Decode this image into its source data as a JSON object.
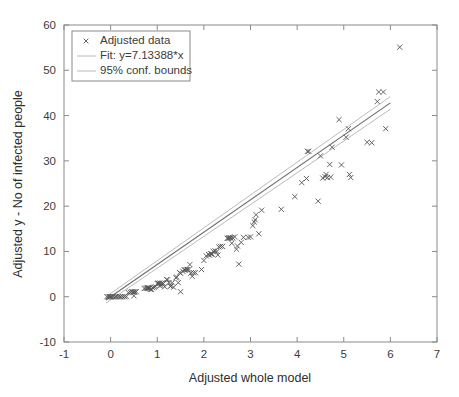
{
  "chart_data": {
    "type": "scatter",
    "title": "",
    "xlabel": "Adjusted whole model",
    "ylabel": "Adjusted y - No of infected people",
    "xlim": [
      -1,
      7
    ],
    "ylim": [
      -10,
      60
    ],
    "xticks": [
      -1,
      0,
      1,
      2,
      3,
      4,
      5,
      6,
      7
    ],
    "xticklabels": [
      "-1",
      "0",
      "1",
      "2",
      "3",
      "4",
      "5",
      "6",
      "7"
    ],
    "yticks": [
      -10,
      0,
      10,
      20,
      30,
      40,
      50,
      60
    ],
    "yticklabels": [
      "-10",
      "0",
      "10",
      "20",
      "30",
      "40",
      "50",
      "60"
    ],
    "grid": false,
    "legend_position": "upper-left",
    "legend": [
      {
        "label": "Adjusted data",
        "marker": "x",
        "type": "marker"
      },
      {
        "label": "Fit: y=7.13388*x",
        "marker": "line",
        "type": "line"
      },
      {
        "label": "95% conf. bounds",
        "marker": "line",
        "type": "line"
      }
    ],
    "fit": {
      "equation": "y=7.13388*x",
      "slope": 7.13388,
      "intercept": 0,
      "x_start": -0.1,
      "x_end": 6.0
    },
    "confidence": {
      "level": "95%",
      "half_width_at_x_start": 0.7,
      "half_width_at_x_end": 1.4
    },
    "series": [
      {
        "name": "Adjusted data",
        "marker": "x",
        "points": [
          [
            -0.08,
            0.0
          ],
          [
            -0.05,
            0.0
          ],
          [
            -0.02,
            0.0
          ],
          [
            0.0,
            0.0
          ],
          [
            0.03,
            0.0
          ],
          [
            0.06,
            0.0
          ],
          [
            0.1,
            0.0
          ],
          [
            0.16,
            0.0
          ],
          [
            0.22,
            0.0
          ],
          [
            0.3,
            0.0
          ],
          [
            0.38,
            0.9
          ],
          [
            0.42,
            1.0
          ],
          [
            0.45,
            1.1
          ],
          [
            0.48,
            1.1
          ],
          [
            0.5,
            1.0
          ],
          [
            0.52,
            1.1
          ],
          [
            0.55,
            1.1
          ],
          [
            0.5,
            0.2
          ],
          [
            0.72,
            1.8
          ],
          [
            0.75,
            1.9
          ],
          [
            0.78,
            1.9
          ],
          [
            0.8,
            1.9
          ],
          [
            0.82,
            1.9
          ],
          [
            0.85,
            1.6
          ],
          [
            0.88,
            1.6
          ],
          [
            0.9,
            2.0
          ],
          [
            0.93,
            2.1
          ],
          [
            0.96,
            2.2
          ],
          [
            1.0,
            2.9
          ],
          [
            1.02,
            3.0
          ],
          [
            1.05,
            2.4
          ],
          [
            1.08,
            2.5
          ],
          [
            1.1,
            3.0
          ],
          [
            1.13,
            2.9
          ],
          [
            1.16,
            2.2
          ],
          [
            1.2,
            3.8
          ],
          [
            1.22,
            3.7
          ],
          [
            1.25,
            3.1
          ],
          [
            1.28,
            2.3
          ],
          [
            1.3,
            2.4
          ],
          [
            1.32,
            3.1
          ],
          [
            1.35,
            2.1
          ],
          [
            1.4,
            4.2
          ],
          [
            1.42,
            4.3
          ],
          [
            1.45,
            3.1
          ],
          [
            1.48,
            5.3
          ],
          [
            1.5,
            5.2
          ],
          [
            1.5,
            1.1
          ],
          [
            1.55,
            5.6
          ],
          [
            1.58,
            5.9
          ],
          [
            1.6,
            5.9
          ],
          [
            1.62,
            6.0
          ],
          [
            1.65,
            6.0
          ],
          [
            1.68,
            6.0
          ],
          [
            1.7,
            7.1
          ],
          [
            1.72,
            5.2
          ],
          [
            1.75,
            4.5
          ],
          [
            1.78,
            5.3
          ],
          [
            1.82,
            5.3
          ],
          [
            1.95,
            6.0
          ],
          [
            2.0,
            8.0
          ],
          [
            2.05,
            9.0
          ],
          [
            2.1,
            9.3
          ],
          [
            2.15,
            9.5
          ],
          [
            2.18,
            9.4
          ],
          [
            2.2,
            10.0
          ],
          [
            2.24,
            10.1
          ],
          [
            2.28,
            10.0
          ],
          [
            2.3,
            9.2
          ],
          [
            2.32,
            11.0
          ],
          [
            2.36,
            11.1
          ],
          [
            2.4,
            11.1
          ],
          [
            2.5,
            12.9
          ],
          [
            2.54,
            13.0
          ],
          [
            2.58,
            13.0
          ],
          [
            2.62,
            13.0
          ],
          [
            2.6,
            11.8
          ],
          [
            2.66,
            13.2
          ],
          [
            2.7,
            10.5
          ],
          [
            2.72,
            11.2
          ],
          [
            2.75,
            7.2
          ],
          [
            2.8,
            12.0
          ],
          [
            2.85,
            13.1
          ],
          [
            2.95,
            13.1
          ],
          [
            3.0,
            13.2
          ],
          [
            3.05,
            15.7
          ],
          [
            3.08,
            16.5
          ],
          [
            3.1,
            17.0
          ],
          [
            3.12,
            18.1
          ],
          [
            3.18,
            13.9
          ],
          [
            3.24,
            19.1
          ],
          [
            3.66,
            19.3
          ],
          [
            3.95,
            22.1
          ],
          [
            4.1,
            25.2
          ],
          [
            4.2,
            26.1
          ],
          [
            4.22,
            32.1
          ],
          [
            4.25,
            32.1
          ],
          [
            4.45,
            21.1
          ],
          [
            4.5,
            31.1
          ],
          [
            4.55,
            26.2
          ],
          [
            4.6,
            26.5
          ],
          [
            4.62,
            27.0
          ],
          [
            4.65,
            26.3
          ],
          [
            4.7,
            29.2
          ],
          [
            4.72,
            26.4
          ],
          [
            4.75,
            33.0
          ],
          [
            4.9,
            39.1
          ],
          [
            4.95,
            29.1
          ],
          [
            5.05,
            35.2
          ],
          [
            5.1,
            37.1
          ],
          [
            5.12,
            27.0
          ],
          [
            5.15,
            26.3
          ],
          [
            5.5,
            34.1
          ],
          [
            5.6,
            34.0
          ],
          [
            5.72,
            43.1
          ],
          [
            5.75,
            45.2
          ],
          [
            5.85,
            45.2
          ],
          [
            5.9,
            37.1
          ],
          [
            6.2,
            55.1
          ],
          [
            0.12,
            0.0
          ],
          [
            0.2,
            0.0
          ],
          [
            0.26,
            0.0
          ],
          [
            0.34,
            0.0
          ],
          [
            0.8,
            2.0
          ],
          [
            0.84,
            1.9
          ],
          [
            1.04,
            2.9
          ],
          [
            1.06,
            3.0
          ],
          [
            2.12,
            9.2
          ],
          [
            2.16,
            9.4
          ],
          [
            2.52,
            12.9
          ],
          [
            2.56,
            13.0
          ]
        ]
      }
    ]
  }
}
